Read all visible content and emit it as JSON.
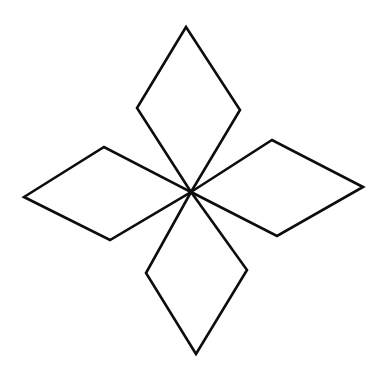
{
  "figure": {
    "name": "four-petal-star",
    "canvas": {
      "width": 392,
      "height": 371,
      "background_color": "#ffffff"
    },
    "style": {
      "stroke_color": "#0d0d0d",
      "fill_color": "#ffffff",
      "stroke_width": 2.6
    },
    "center": {
      "x": 191,
      "y": 192
    },
    "petal_count": 4,
    "petals": [
      {
        "name": "top-petal",
        "label": "Top Diamond",
        "direction": "up",
        "tip": {
          "x": 186,
          "y": 27
        },
        "points": "186,27 137,108 191,192 240,110",
        "vertices": [
          {
            "role": "tip",
            "x": 186,
            "y": 27
          },
          {
            "role": "left",
            "x": 137,
            "y": 108
          },
          {
            "role": "center",
            "x": 191,
            "y": 192
          },
          {
            "role": "right",
            "x": 240,
            "y": 110
          }
        ]
      },
      {
        "name": "left-petal",
        "label": "Left Diamond",
        "direction": "left",
        "tip": {
          "x": 24,
          "y": 197
        },
        "points": "24,197 104,147 191,192 110,240",
        "vertices": [
          {
            "role": "tip",
            "x": 24,
            "y": 197
          },
          {
            "role": "top",
            "x": 104,
            "y": 147
          },
          {
            "role": "center",
            "x": 191,
            "y": 192
          },
          {
            "role": "bottom",
            "x": 110,
            "y": 240
          }
        ]
      },
      {
        "name": "right-petal",
        "label": "Right Diamond",
        "direction": "right",
        "tip": {
          "x": 363,
          "y": 187
        },
        "points": "363,187 272,140 191,192 277,236",
        "vertices": [
          {
            "role": "tip",
            "x": 363,
            "y": 187
          },
          {
            "role": "top",
            "x": 272,
            "y": 140
          },
          {
            "role": "center",
            "x": 191,
            "y": 192
          },
          {
            "role": "bottom",
            "x": 277,
            "y": 236
          }
        ]
      },
      {
        "name": "bottom-petal",
        "label": "Bottom Diamond",
        "direction": "down",
        "tip": {
          "x": 196,
          "y": 354
        },
        "points": "196,354 146,273 191,192 247,270",
        "vertices": [
          {
            "role": "tip",
            "x": 196,
            "y": 354
          },
          {
            "role": "left",
            "x": 146,
            "y": 273
          },
          {
            "role": "center",
            "x": 191,
            "y": 192
          },
          {
            "role": "right",
            "x": 247,
            "y": 270
          }
        ]
      }
    ]
  }
}
